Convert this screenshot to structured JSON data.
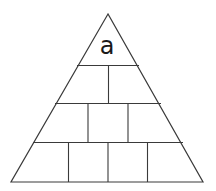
{
  "diagram": {
    "type": "number-pyramid",
    "top_label": "a",
    "rows": [
      {
        "row": 1,
        "cells": [
          "a"
        ]
      },
      {
        "row": 2,
        "cells": [
          "",
          ""
        ]
      },
      {
        "row": 3,
        "cells": [
          "",
          "",
          ""
        ]
      },
      {
        "row": 4,
        "cells": [
          "",
          "",
          "",
          ""
        ]
      }
    ],
    "colors": {
      "stroke": "#3a3a3a",
      "background": "#ffffff",
      "text": "#1a1a1a"
    }
  }
}
